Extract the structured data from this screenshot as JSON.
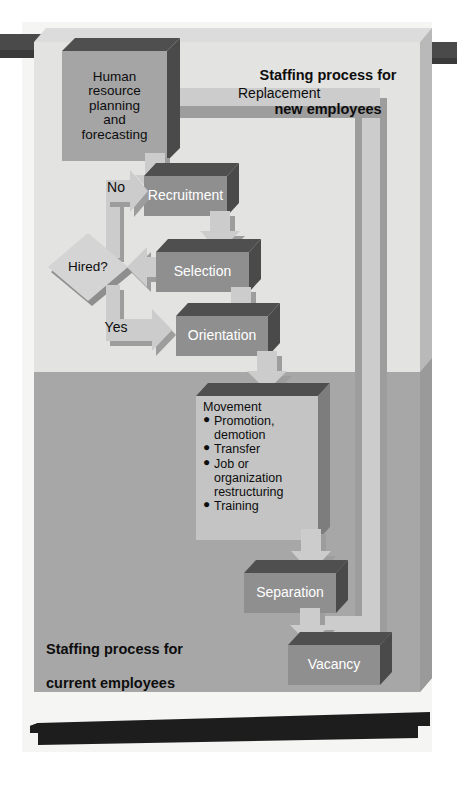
{
  "figure": {
    "kind": "flowchart"
  },
  "panels": {
    "upper": {
      "title_line1": "Staffing process for",
      "title_line2": "new employees",
      "fill": "#e2e2e2"
    },
    "lower": {
      "title_line1": "Staffing process for",
      "title_line2": "current employees",
      "fill": "#a6a6a6"
    }
  },
  "nodes": {
    "hr_planning": {
      "label": "Human\nresource\nplanning\nand\nforecasting",
      "shape": "process",
      "fill": "#a3a3a3",
      "text_color": "#0d0d0d"
    },
    "recruitment": {
      "label": "Recruitment",
      "shape": "process",
      "fill": "#8f8f8f",
      "text_color": "#ffffff"
    },
    "hired_decision": {
      "label": "Hired?",
      "shape": "decision",
      "fill": "#d2d2d2",
      "text_color": "#0d0d0d"
    },
    "selection": {
      "label": "Selection",
      "shape": "process",
      "fill": "#8f8f8f",
      "text_color": "#ffffff"
    },
    "orientation": {
      "label": "Orientation",
      "shape": "process",
      "fill": "#8f8f8f",
      "text_color": "#ffffff"
    },
    "movement": {
      "title": "Movement",
      "shape": "process-list",
      "fill": "#c3c3c3",
      "text_color": "#0d0d0d",
      "items": [
        {
          "text": "Promotion,",
          "sub": "demotion"
        },
        {
          "text": "Transfer",
          "sub": ""
        },
        {
          "text": "Job or",
          "sub": "organization\nrestructuring"
        },
        {
          "text": "Training",
          "sub": ""
        }
      ]
    },
    "separation": {
      "label": "Separation",
      "shape": "process",
      "fill": "#8f8f8f",
      "text_color": "#ffffff"
    },
    "vacancy": {
      "label": "Vacancy",
      "shape": "process",
      "fill": "#8f8f8f",
      "text_color": "#ffffff"
    }
  },
  "edges": {
    "replacement": {
      "label": "Replacement",
      "from": "vacancy",
      "to": "hr_planning"
    },
    "no_branch": {
      "label": "No",
      "from": "hired_decision",
      "to": "recruitment"
    },
    "yes_branch": {
      "label": "Yes",
      "from": "hired_decision",
      "to": "orientation"
    }
  },
  "colors": {
    "arrow_fill": "#bdbdbd",
    "arrow_shadow": "#8a8a8a",
    "box_shadow_dark": "#5c5c5c",
    "box_top_mid": "#707070",
    "panel_frame": "#cfcfcf",
    "panel_edge": "#b4b4b4",
    "band_dark": "#474747",
    "banner_black": "#1b1b1b",
    "page_bg": "#ffffff",
    "paper_tint": "#f4f4f2"
  }
}
